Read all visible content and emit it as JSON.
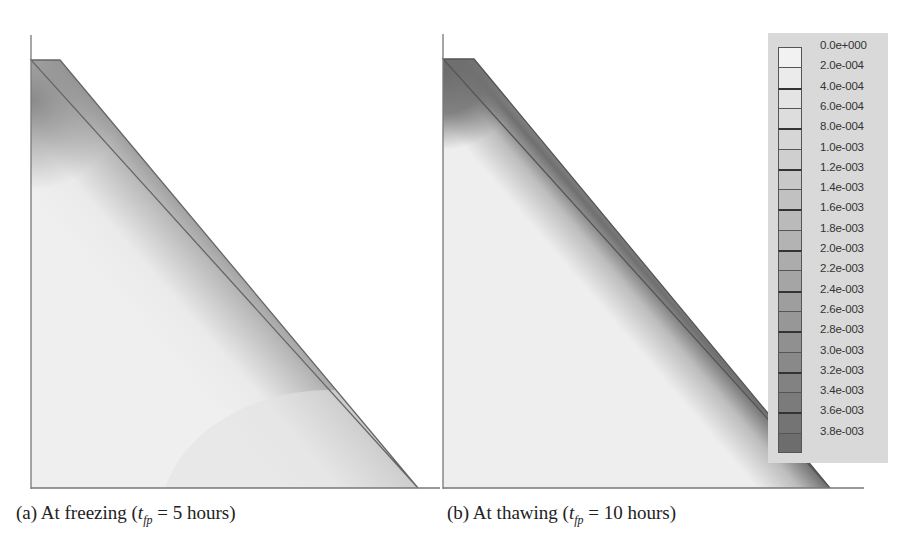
{
  "chart_data": [
    {
      "type": "heatmap",
      "title": "(a) At freezing (t_fp = 5 hours)",
      "panel_label": "(a)",
      "condition": "At freezing",
      "time_var": "t",
      "time_sub": "fp",
      "time_value": "5 hours",
      "geometry": "trapezoidal cross-section (flat top, sloped right face)",
      "pattern": "broad dark band parallel to sloped face; dark region near top-left; light interior"
    },
    {
      "type": "heatmap",
      "title": "(b) At thawing (t_fp = 10 hours)",
      "panel_label": "(b)",
      "condition": "At thawing",
      "time_var": "t",
      "time_sub": "fp",
      "time_value": "10 hours",
      "geometry": "trapezoidal cross-section (flat top, sloped right face)",
      "pattern": "narrower dark band slightly inside sloped face; dark top-left cap; light interior"
    }
  ],
  "captions": {
    "a": {
      "prefix": "(a) At freezing (",
      "var": "t",
      "sub": "fp",
      "suffix": " = 5 hours)"
    },
    "b": {
      "prefix": "(b) At thawing (",
      "var": "t",
      "sub": "fp",
      "suffix": " = 10 hours)"
    }
  },
  "legend": {
    "labels": [
      "0.0e+000",
      "2.0e-004",
      "4.0e-004",
      "6.0e-004",
      "8.0e-004",
      "1.0e-003",
      "1.2e-003",
      "1.4e-003",
      "1.6e-003",
      "1.8e-003",
      "2.0e-003",
      "2.2e-003",
      "2.4e-003",
      "2.6e-003",
      "2.8e-003",
      "3.0e-003",
      "3.2e-003",
      "3.4e-003",
      "3.6e-003",
      "3.8e-003"
    ],
    "colors": [
      "#f2f2f2",
      "#ebebeb",
      "#e4e4e4",
      "#dddddd",
      "#d6d6d6",
      "#cfcfcf",
      "#c8c8c8",
      "#c1c1c1",
      "#bababa",
      "#b3b3b3",
      "#acacac",
      "#a5a5a5",
      "#9e9e9e",
      "#979797",
      "#909090",
      "#898989",
      "#828282",
      "#7b7b7b",
      "#747474",
      "#6d6d6d"
    ]
  }
}
